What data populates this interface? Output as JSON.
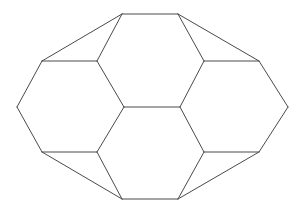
{
  "figure": {
    "name": "polyhedron-wireframe",
    "type": "line-drawing",
    "canvas": {
      "width": 305,
      "height": 213
    },
    "background_color": "#ffffff",
    "stroke_color": "#4a4a4a",
    "stroke_width": 1,
    "fill": "none",
    "vertices": {
      "top_left": [
        122,
        14
      ],
      "top_right": [
        178,
        14
      ],
      "upper_left_out": [
        42,
        61
      ],
      "upper_left_in": [
        97,
        61
      ],
      "upper_right_in": [
        204,
        61
      ],
      "upper_right_out": [
        259,
        61
      ],
      "left_point": [
        17,
        107
      ],
      "mid_left": [
        124,
        107
      ],
      "mid_right": [
        180,
        107
      ],
      "right_point": [
        288,
        107
      ],
      "lower_left_out": [
        42,
        152
      ],
      "lower_left_in": [
        97,
        152
      ],
      "lower_right_in": [
        204,
        152
      ],
      "lower_right_out": [
        259,
        152
      ],
      "bottom_left": [
        122,
        199
      ],
      "bottom_right": [
        178,
        199
      ]
    },
    "edges": [
      {
        "name": "top-edge",
        "from": [
          122,
          14
        ],
        "to": [
          178,
          14
        ]
      },
      {
        "name": "top-left-outer-slant",
        "from": [
          122,
          14
        ],
        "to": [
          42,
          61
        ]
      },
      {
        "name": "top-left-inner-slant",
        "from": [
          122,
          14
        ],
        "to": [
          97,
          61
        ]
      },
      {
        "name": "top-right-inner-slant",
        "from": [
          178,
          14
        ],
        "to": [
          204,
          61
        ]
      },
      {
        "name": "top-right-outer-slant",
        "from": [
          178,
          14
        ],
        "to": [
          259,
          61
        ]
      },
      {
        "name": "upper-left-horizontal",
        "from": [
          42,
          61
        ],
        "to": [
          97,
          61
        ]
      },
      {
        "name": "upper-right-horizontal",
        "from": [
          204,
          61
        ],
        "to": [
          259,
          61
        ]
      },
      {
        "name": "left-upper-outer-edge",
        "from": [
          42,
          61
        ],
        "to": [
          17,
          107
        ]
      },
      {
        "name": "right-upper-outer-edge",
        "from": [
          259,
          61
        ],
        "to": [
          288,
          107
        ]
      },
      {
        "name": "center-upper-left-side",
        "from": [
          97,
          61
        ],
        "to": [
          124,
          107
        ]
      },
      {
        "name": "center-upper-right-side",
        "from": [
          204,
          61
        ],
        "to": [
          180,
          107
        ]
      },
      {
        "name": "center-horizontal",
        "from": [
          124,
          107
        ],
        "to": [
          180,
          107
        ]
      },
      {
        "name": "left-lower-outer-edge",
        "from": [
          17,
          107
        ],
        "to": [
          42,
          152
        ]
      },
      {
        "name": "right-lower-outer-edge",
        "from": [
          288,
          107
        ],
        "to": [
          259,
          152
        ]
      },
      {
        "name": "center-lower-left-side",
        "from": [
          124,
          107
        ],
        "to": [
          97,
          152
        ]
      },
      {
        "name": "center-lower-right-side",
        "from": [
          180,
          107
        ],
        "to": [
          204,
          152
        ]
      },
      {
        "name": "lower-left-horizontal",
        "from": [
          42,
          152
        ],
        "to": [
          97,
          152
        ]
      },
      {
        "name": "lower-right-horizontal",
        "from": [
          204,
          152
        ],
        "to": [
          259,
          152
        ]
      },
      {
        "name": "bottom-left-outer-slant",
        "from": [
          42,
          152
        ],
        "to": [
          122,
          199
        ]
      },
      {
        "name": "bottom-left-inner-slant",
        "from": [
          97,
          152
        ],
        "to": [
          122,
          199
        ]
      },
      {
        "name": "bottom-right-inner-slant",
        "from": [
          204,
          152
        ],
        "to": [
          178,
          199
        ]
      },
      {
        "name": "bottom-right-outer-slant",
        "from": [
          259,
          152
        ],
        "to": [
          178,
          199
        ]
      },
      {
        "name": "bottom-edge",
        "from": [
          122,
          199
        ],
        "to": [
          178,
          199
        ]
      }
    ],
    "faces": [
      {
        "name": "upper-center-hexagon",
        "points": "122,14 178,14 204,61 180,107 124,107 97,61"
      },
      {
        "name": "lower-center-hexagon",
        "points": "124,107 180,107 204,152 178,199 122,199 97,152"
      },
      {
        "name": "left-hexagon",
        "points": "42,61 97,61 124,107 97,152 42,152 17,107"
      },
      {
        "name": "right-hexagon",
        "points": "204,61 259,61 288,107 259,152 204,152 180,107"
      },
      {
        "name": "upper-left-triangle",
        "points": "122,14 97,61 42,61"
      },
      {
        "name": "upper-right-triangle",
        "points": "178,14 259,61 204,61"
      },
      {
        "name": "lower-left-triangle",
        "points": "122,199 42,152 97,152"
      },
      {
        "name": "lower-right-triangle",
        "points": "178,199 204,152 259,152"
      }
    ]
  }
}
